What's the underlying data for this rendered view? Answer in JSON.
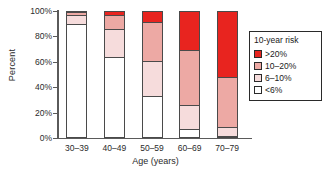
{
  "chart_data": {
    "type": "bar",
    "subtype": "stacked-percentage",
    "title": "",
    "xlabel": "Age (years)",
    "ylabel": "Percent",
    "categories": [
      "30–39",
      "40–49",
      "50–59",
      "60–69",
      "70–79"
    ],
    "ylim": [
      0,
      100
    ],
    "yticks": [
      "0%",
      "20%",
      "40%",
      "60%",
      "80%",
      "100%"
    ],
    "ytick_values": [
      0,
      20,
      40,
      60,
      80,
      100
    ],
    "grid": false,
    "legend_position": "right",
    "legend_title": "10-year risk",
    "series": [
      {
        "name": "<6%",
        "color": "#ffffff",
        "values": [
          90,
          64,
          33,
          7,
          1
        ]
      },
      {
        "name": "6–10%",
        "color": "#f6dcdc",
        "values": [
          7,
          22,
          28,
          19,
          7
        ]
      },
      {
        "name": "10–20%",
        "color": "#eda9a4",
        "values": [
          2,
          11,
          30,
          43,
          40
        ]
      },
      {
        "name": ">20%",
        "color": "#e8241f",
        "values": [
          1,
          3,
          9,
          31,
          52
        ]
      }
    ]
  },
  "axes": {
    "ylabel": "Percent",
    "xlabel": "Age (years)",
    "ytick_labels": [
      "100%",
      "80%",
      "60%",
      "40%",
      "20%",
      "0%"
    ],
    "xtick_labels": [
      "30–39",
      "40–49",
      "50–59",
      "60–69",
      "70–79"
    ]
  },
  "legend": {
    "title": "10-year risk",
    "items": [
      {
        "label": ">20%",
        "color": "#e8241f"
      },
      {
        "label": "10–20%",
        "color": "#eda9a4"
      },
      {
        "label": "6–10%",
        "color": "#f6dcdc"
      },
      {
        "label": "<6%",
        "color": "#ffffff"
      }
    ]
  },
  "colors": {
    "axis": "#5a5a5a",
    "bar_outline": "#4a4a4a",
    "text": "#2b2b2b",
    "background": "#ffffff"
  }
}
